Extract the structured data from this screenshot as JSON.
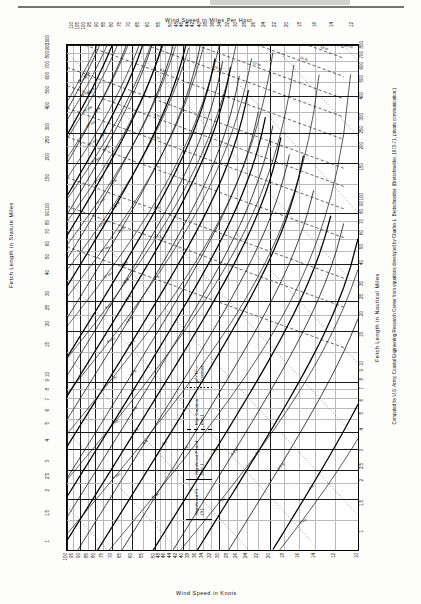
{
  "figure": {
    "axes": {
      "top_title": "Wind Speed in Miles Per Hour",
      "bottom_title": "Wind Speed in Knots",
      "left_title": "Fetch Length in Statute Miles",
      "right_title": "Fetch Length in Nautical Miles"
    },
    "credit": "Computed by U.S. Army, Coastal Engineering Research Center from equations developed by Charles L. Bretschneider, (Bretschneider, 1970-71, private communication.)",
    "legend": {
      "items": [
        {
          "style": "solid",
          "label": "Significant Ht. (ft.)"
        },
        {
          "style": "solid",
          "label": "Significant Period (sec.)"
        },
        {
          "style": "dash",
          "label": "Min. Duration (hrs.)"
        },
        {
          "style": "dot",
          "label": "gt² / F² = Constant"
        }
      ]
    }
  },
  "chart_data": {
    "type": "line",
    "xlabel": "Wind Speed in Knots",
    "ylabel": "Fetch Length in Statute Miles",
    "x_top_label": "Wind Speed in Miles Per Hour",
    "y_right_label": "Fetch Length in Nautical Miles",
    "xscale": "log",
    "yscale": "log",
    "grid": true,
    "legend_position": "center-right-inside",
    "xlim_knots": [
      10,
      100
    ],
    "ylim_statute_miles": [
      1,
      1000
    ],
    "x_ticks_mph_top": [
      "110",
      "105",
      "100",
      "95",
      "90",
      "85",
      "80",
      "75",
      "70",
      "65",
      "60",
      "55",
      "50",
      "48",
      "46",
      "44",
      "42",
      "40",
      "38",
      "36",
      "34",
      "32",
      "30",
      "28",
      "26",
      "24",
      "22",
      "20",
      "18",
      "16",
      "14",
      "12"
    ],
    "x_ticks_knots_bottom": [
      "100",
      "95",
      "90",
      "85",
      "80",
      "75",
      "70",
      "65",
      "60",
      "55",
      "50",
      "48",
      "46",
      "44",
      "42",
      "40",
      "38",
      "36",
      "34",
      "32",
      "30",
      "28",
      "26",
      "24",
      "22",
      "20",
      "18",
      "16",
      "14",
      "12",
      "10"
    ],
    "y_ticks_statute_left": [
      "1000",
      "900",
      "800",
      "700",
      "600",
      "500",
      "400",
      "300",
      "250",
      "200",
      "150",
      "100",
      "90",
      "80",
      "70",
      "60",
      "50",
      "40",
      "30",
      "25",
      "20",
      "15",
      "10",
      "9",
      "8",
      "7",
      "6",
      "5",
      "4",
      "3",
      "2.5",
      "2",
      "1.5",
      "1"
    ],
    "y_ticks_nautical_right": [
      "1000",
      "900",
      "800",
      "700",
      "600",
      "500",
      "400",
      "300",
      "250",
      "200",
      "150",
      "100",
      "90",
      "80",
      "70",
      "60",
      "50",
      "40",
      "30",
      "25",
      "20",
      "15",
      "10",
      "9",
      "8",
      "7",
      "6",
      "5",
      "4",
      "3",
      "2.5",
      "2",
      "1.5",
      "1"
    ],
    "series": [
      {
        "name": "Significant Height (ft.)",
        "style": "solid",
        "units": "ft",
        "values": [
          "1",
          "1.5",
          "2",
          "2.5",
          "3",
          "4",
          "5",
          "6",
          "7",
          "8",
          "9",
          "10",
          "12",
          "14",
          "16",
          "18",
          "20",
          "25",
          "30",
          "35",
          "40",
          "45",
          "50",
          "60",
          "70",
          "80"
        ]
      },
      {
        "name": "Significant Period (sec.)",
        "style": "solid",
        "units": "sec",
        "values": [
          "2",
          "3",
          "4",
          "5",
          "6",
          "7",
          "8",
          "9",
          "10",
          "11",
          "12",
          "13",
          "14",
          "15",
          "16",
          "17",
          "18",
          "19",
          "20"
        ]
      },
      {
        "name": "Minimum Duration (hrs.)",
        "style": "dash",
        "units": "hr",
        "values": [
          "1",
          "1.5",
          "2",
          "3",
          "4",
          "5",
          "6",
          "8",
          "10",
          "12",
          "15",
          "18",
          "20",
          "24",
          "30",
          "36",
          "42",
          "48",
          "60",
          "72",
          "84",
          "96",
          "120",
          "144"
        ]
      },
      {
        "name": "gt²/F² = Constant",
        "style": "dot",
        "units": "",
        "values": [
          "constant-family"
        ]
      }
    ]
  }
}
